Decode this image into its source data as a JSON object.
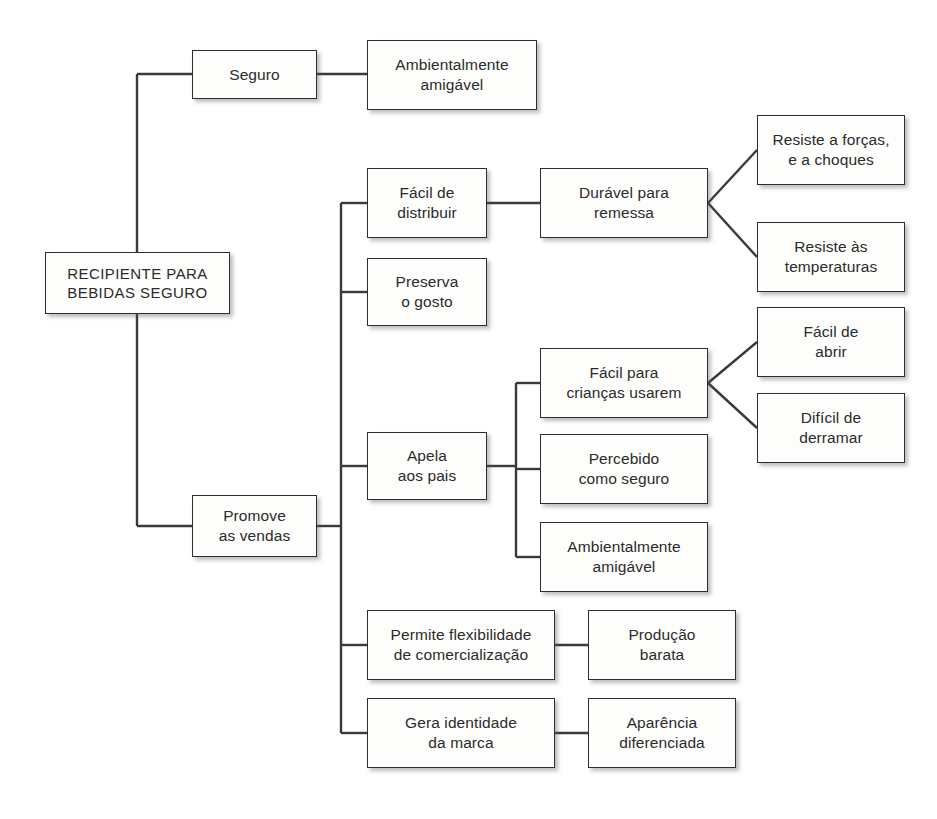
{
  "diagram": {
    "title": "RECIPIENTE PARA BEBIDAS SEGURO",
    "type": "tree-diagram",
    "language": "pt-BR",
    "colors": {
      "background": "#ffffff",
      "box_fill": "#fdfdfc",
      "box_border": "#2e2e2e",
      "text": "#2b2b2b",
      "connector": "#3a3a3a",
      "shadow": "rgba(90,88,86,0.40)"
    },
    "nodes": [
      {
        "id": "root",
        "label": "RECIPIENTE PARA\nBEBIDAS SEGURO",
        "level": 0,
        "x": 45,
        "y": 252,
        "w": 185,
        "h": 62
      },
      {
        "id": "seguro",
        "label": "Seguro",
        "level": 1,
        "x": 192,
        "y": 50,
        "w": 125,
        "h": 49
      },
      {
        "id": "promove",
        "label": "Promove\nas vendas",
        "level": 1,
        "x": 192,
        "y": 495,
        "w": 125,
        "h": 62
      },
      {
        "id": "ambiental-top",
        "label": "Ambientalmente\namigável",
        "level": 2,
        "x": 367,
        "y": 40,
        "w": 170,
        "h": 70
      },
      {
        "id": "facil-distribuir",
        "label": "Fácil de\ndistribuir",
        "level": 2,
        "x": 367,
        "y": 168,
        "w": 120,
        "h": 70
      },
      {
        "id": "preserva",
        "label": "Preserva\no gosto",
        "level": 2,
        "x": 367,
        "y": 258,
        "w": 120,
        "h": 68
      },
      {
        "id": "apela",
        "label": "Apela\naos pais",
        "level": 2,
        "x": 367,
        "y": 432,
        "w": 120,
        "h": 68
      },
      {
        "id": "flexibilidade",
        "label": "Permite flexibilidade\nde comercialização",
        "level": 2,
        "x": 367,
        "y": 610,
        "w": 188,
        "h": 70
      },
      {
        "id": "identidade",
        "label": "Gera identidade\nda marca",
        "level": 2,
        "x": 367,
        "y": 698,
        "w": 188,
        "h": 70
      },
      {
        "id": "duravel",
        "label": "Durável para\nremessa",
        "level": 3,
        "x": 540,
        "y": 168,
        "w": 168,
        "h": 70
      },
      {
        "id": "facil-criancas",
        "label": "Fácil para\ncrianças usarem",
        "level": 3,
        "x": 540,
        "y": 348,
        "w": 168,
        "h": 70
      },
      {
        "id": "percebido",
        "label": "Percebido\ncomo seguro",
        "level": 3,
        "x": 540,
        "y": 434,
        "w": 168,
        "h": 70
      },
      {
        "id": "ambiental-mid",
        "label": "Ambientalmente\namigável",
        "level": 3,
        "x": 540,
        "y": 522,
        "w": 168,
        "h": 70
      },
      {
        "id": "producao",
        "label": "Produção\nbarata",
        "level": 3,
        "x": 588,
        "y": 610,
        "w": 148,
        "h": 70
      },
      {
        "id": "aparencia",
        "label": "Aparência\ndiferenciada",
        "level": 3,
        "x": 588,
        "y": 698,
        "w": 148,
        "h": 70
      },
      {
        "id": "forcas",
        "label": "Resiste a forças,\ne a choques",
        "level": 4,
        "x": 757,
        "y": 115,
        "w": 148,
        "h": 70
      },
      {
        "id": "temperaturas",
        "label": "Resiste às\ntemperaturas",
        "level": 4,
        "x": 757,
        "y": 222,
        "w": 148,
        "h": 70
      },
      {
        "id": "abrir",
        "label": "Fácil de\nabrir",
        "level": 4,
        "x": 757,
        "y": 307,
        "w": 148,
        "h": 70
      },
      {
        "id": "derramar",
        "label": "Difícil de\nderramar",
        "level": 4,
        "x": 757,
        "y": 393,
        "w": 148,
        "h": 70
      }
    ],
    "connectors": {
      "root_trunk_x": 137,
      "promove_trunk_x": 341,
      "apela_trunk_x": 516,
      "style": "orthogonal-with-fan"
    },
    "edges": [
      {
        "from": "root",
        "to": "seguro",
        "style": "orthogonal"
      },
      {
        "from": "root",
        "to": "promove",
        "style": "orthogonal"
      },
      {
        "from": "seguro",
        "to": "ambiental-top",
        "style": "straight"
      },
      {
        "from": "promove",
        "to": "facil-distribuir",
        "style": "orthogonal"
      },
      {
        "from": "promove",
        "to": "preserva",
        "style": "orthogonal"
      },
      {
        "from": "promove",
        "to": "apela",
        "style": "orthogonal"
      },
      {
        "from": "promove",
        "to": "flexibilidade",
        "style": "orthogonal"
      },
      {
        "from": "promove",
        "to": "identidade",
        "style": "orthogonal"
      },
      {
        "from": "facil-distribuir",
        "to": "duravel",
        "style": "straight"
      },
      {
        "from": "duravel",
        "to": "forcas",
        "style": "fan"
      },
      {
        "from": "duravel",
        "to": "temperaturas",
        "style": "fan"
      },
      {
        "from": "apela",
        "to": "facil-criancas",
        "style": "orthogonal"
      },
      {
        "from": "apela",
        "to": "percebido",
        "style": "orthogonal"
      },
      {
        "from": "apela",
        "to": "ambiental-mid",
        "style": "orthogonal"
      },
      {
        "from": "facil-criancas",
        "to": "abrir",
        "style": "fan"
      },
      {
        "from": "facil-criancas",
        "to": "derramar",
        "style": "fan"
      },
      {
        "from": "flexibilidade",
        "to": "producao",
        "style": "straight"
      },
      {
        "from": "identidade",
        "to": "aparencia",
        "style": "straight"
      }
    ]
  }
}
